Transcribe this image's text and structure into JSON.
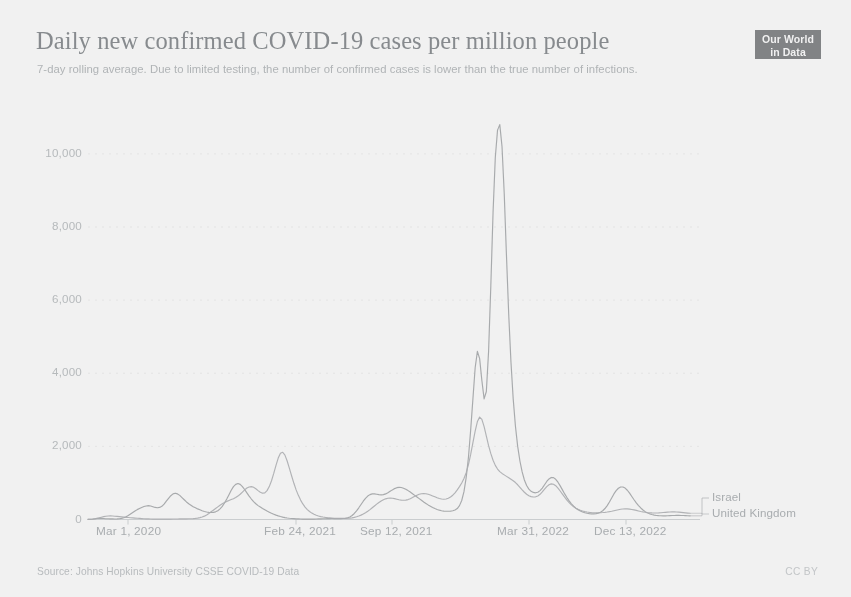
{
  "header": {
    "title": "Daily new confirmed COVID-19 cases per million people",
    "subtitle": "7-day rolling average. Due to limited testing, the number of confirmed cases is lower than the true number of infections.",
    "logo_line1": "Our World",
    "logo_line2": "in Data"
  },
  "footer": {
    "source": "Source: Johns Hopkins University CSSE COVID-19 Data",
    "license": "CC BY"
  },
  "colors": {
    "israel": "#8f9296",
    "united_kingdom": "#9da0a4",
    "axis_text": "#a6abae",
    "title_text": "#6d7377",
    "gridline": "#ededed",
    "logo_bg": "#45484c"
  },
  "chart_data": {
    "type": "line",
    "title": "Daily new confirmed COVID-19 cases per million people",
    "subtitle": "7-day rolling average. Due to limited testing, the number of confirmed cases is lower than the true number of infections.",
    "xlabel": "",
    "ylabel": "",
    "ylim": [
      0,
      11200
    ],
    "yticks": [
      0,
      2000,
      4000,
      6000,
      8000,
      10000
    ],
    "ytick_labels": [
      "0",
      "2,000",
      "4,000",
      "6,000",
      "8,000",
      "10,000"
    ],
    "xticks": [
      "Mar 1, 2020",
      "Feb 24, 2021",
      "Sep 12, 2021",
      "Mar 31, 2022",
      "Dec 13, 2022"
    ],
    "xtick_positions_px": [
      96,
      264,
      360,
      497,
      594
    ],
    "grid": true,
    "legend_position": "right-inline",
    "x_start": "Mar 1, 2020",
    "x_end": "Jan 2023",
    "series": [
      {
        "name": "Israel",
        "color": "#8f9296",
        "peak_value": 10800,
        "peak_date": "Jan 2022",
        "values": [
          5,
          8,
          14,
          22,
          30,
          34,
          30,
          26,
          22,
          20,
          18,
          16,
          15,
          16,
          20,
          30,
          48,
          75,
          110,
          150,
          190,
          230,
          270,
          300,
          330,
          355,
          370,
          380,
          370,
          350,
          330,
          320,
          330,
          360,
          420,
          500,
          580,
          650,
          700,
          720,
          700,
          660,
          600,
          540,
          480,
          430,
          390,
          350,
          320,
          290,
          265,
          240,
          220,
          205,
          195,
          190,
          195,
          210,
          240,
          290,
          360,
          450,
          560,
          680,
          800,
          900,
          960,
          985,
          960,
          900,
          820,
          730,
          640,
          560,
          490,
          430,
          380,
          340,
          300,
          265,
          230,
          200,
          170,
          145,
          120,
          100,
          82,
          66,
          52,
          42,
          34,
          28,
          23,
          19,
          16,
          14,
          12,
          11,
          10,
          10,
          11,
          12,
          14,
          16,
          18,
          20,
          22,
          24,
          25,
          26,
          26,
          25,
          24,
          24,
          26,
          32,
          45,
          70,
          110,
          165,
          235,
          320,
          410,
          500,
          580,
          640,
          680,
          700,
          700,
          690,
          680,
          675,
          680,
          700,
          730,
          770,
          810,
          845,
          870,
          880,
          875,
          855,
          825,
          790,
          750,
          705,
          660,
          615,
          570,
          525,
          480,
          440,
          400,
          365,
          330,
          300,
          275,
          255,
          240,
          230,
          225,
          225,
          230,
          240,
          260,
          300,
          380,
          520,
          760,
          1150,
          1700,
          2450,
          3300,
          4150,
          4600,
          4400,
          3800,
          3300,
          3500,
          4600,
          6400,
          8400,
          9900,
          10650,
          10800,
          10200,
          8900,
          7200,
          5600,
          4300,
          3300,
          2550,
          2000,
          1600,
          1300,
          1080,
          930,
          830,
          770,
          740,
          730,
          745,
          790,
          860,
          950,
          1040,
          1110,
          1150,
          1145,
          1100,
          1020,
          920,
          810,
          700,
          600,
          510,
          430,
          365,
          310,
          265,
          230,
          205,
          185,
          170,
          160,
          155,
          155,
          160,
          175,
          200,
          240,
          300,
          380,
          480,
          590,
          700,
          790,
          855,
          890,
          890,
          860,
          800,
          720,
          630,
          540,
          455,
          380,
          315,
          260,
          215,
          180,
          155,
          135,
          120,
          110,
          105,
          102,
          100,
          100,
          102,
          105,
          108,
          110,
          112,
          112,
          110,
          108,
          105,
          102,
          100
        ]
      },
      {
        "name": "United Kingdom",
        "color": "#9da0a4",
        "peak_value": 2800,
        "peak_date": "Jan 2022",
        "values": [
          2,
          4,
          8,
          16,
          28,
          44,
          62,
          78,
          90,
          96,
          98,
          95,
          90,
          84,
          78,
          72,
          66,
          60,
          54,
          48,
          43,
          38,
          33,
          29,
          25,
          22,
          19,
          16,
          14,
          12,
          11,
          10,
          9,
          9,
          9,
          10,
          11,
          12,
          13,
          14,
          15,
          16,
          17,
          18,
          19,
          20,
          22,
          25,
          30,
          38,
          50,
          68,
          92,
          125,
          165,
          210,
          255,
          300,
          345,
          390,
          430,
          465,
          495,
          520,
          545,
          570,
          600,
          640,
          690,
          750,
          810,
          860,
          890,
          900,
          880,
          840,
          790,
          745,
          720,
          730,
          790,
          900,
          1060,
          1260,
          1480,
          1680,
          1810,
          1840,
          1760,
          1600,
          1400,
          1190,
          990,
          810,
          660,
          530,
          425,
          340,
          272,
          218,
          175,
          142,
          116,
          96,
          80,
          68,
          58,
          50,
          44,
          39,
          35,
          32,
          30,
          29,
          29,
          30,
          33,
          38,
          46,
          58,
          74,
          95,
          120,
          150,
          185,
          225,
          270,
          320,
          370,
          420,
          465,
          505,
          540,
          565,
          580,
          585,
          580,
          570,
          555,
          540,
          530,
          525,
          530,
          545,
          570,
          600,
          635,
          665,
          690,
          705,
          710,
          705,
          690,
          670,
          645,
          620,
          595,
          575,
          560,
          555,
          560,
          580,
          615,
          665,
          730,
          810,
          900,
          1000,
          1120,
          1280,
          1500,
          1780,
          2100,
          2420,
          2680,
          2800,
          2740,
          2540,
          2280,
          2020,
          1800,
          1620,
          1480,
          1380,
          1310,
          1260,
          1220,
          1180,
          1140,
          1100,
          1060,
          1010,
          950,
          880,
          810,
          745,
          690,
          650,
          625,
          615,
          620,
          645,
          690,
          755,
          830,
          900,
          950,
          975,
          965,
          925,
          860,
          780,
          695,
          610,
          530,
          460,
          400,
          350,
          310,
          278,
          252,
          232,
          216,
          204,
          196,
          190,
          186,
          184,
          184,
          186,
          190,
          196,
          204,
          214,
          226,
          240,
          254,
          268,
          280,
          288,
          292,
          290,
          284,
          274,
          262,
          248,
          234,
          220,
          208,
          198,
          190,
          184,
          180,
          178,
          178,
          180,
          184,
          190,
          196,
          202,
          206,
          208,
          208,
          205,
          200,
          194,
          188,
          182,
          176,
          170
        ]
      }
    ]
  }
}
